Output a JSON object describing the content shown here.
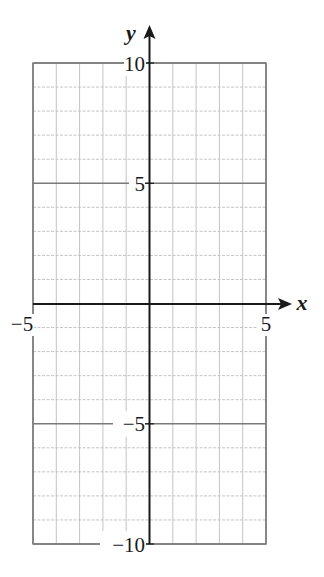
{
  "chart_data": {
    "type": "scatter",
    "title": "",
    "xlabel": "x",
    "ylabel": "y",
    "xlim": [
      -5,
      5
    ],
    "ylim": [
      -10,
      10
    ],
    "grid": true,
    "grid_step": {
      "x": 1,
      "y": 1
    },
    "major_grid_step": {
      "x": 5,
      "y": 5
    },
    "x_ticks": [
      -5,
      5
    ],
    "x_tick_labels": [
      "−5",
      "5"
    ],
    "y_ticks": [
      10,
      5,
      -5,
      -10
    ],
    "y_tick_labels": [
      "10",
      "5",
      "−5",
      "−10"
    ],
    "series": [],
    "legend": null
  },
  "labels": {
    "x_axis": "x",
    "y_axis": "y",
    "x_neg5": "−5",
    "x_pos5": "5",
    "y_10": "10",
    "y_5": "5",
    "y_neg5": "−5",
    "y_neg10": "−10"
  },
  "colors": {
    "axis": "#1a1a1a",
    "minor_grid": "#c4c4c4",
    "major_grid": "#7a7a7a",
    "text": "#1a1a1a"
  }
}
